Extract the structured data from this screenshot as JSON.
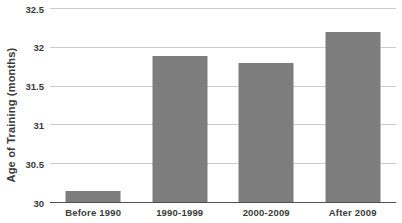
{
  "title": {
    "visible_text": "TRAINING COMPLETED."
  },
  "colors": {
    "bar": "#7d7d7d",
    "gridline": "#cccccc",
    "axis_line": "#4f4f4f",
    "text": "#3a3a3a",
    "background": "#ffffff"
  },
  "chart_data": {
    "type": "bar",
    "title": "TRAINING COMPLETED.",
    "categories": [
      "Before 1990",
      "1990-1999",
      "2000-2009",
      "After 2009"
    ],
    "values": [
      30.15,
      31.9,
      31.8,
      32.2
    ],
    "xlabel": "",
    "ylabel": "Age of Training (months)",
    "ylim": [
      30,
      32.5
    ],
    "yticks": [
      "30",
      "30.5",
      "31",
      "31.5",
      "32",
      "32.5"
    ],
    "grid": "horizontal-gridlines",
    "legend": "none"
  }
}
